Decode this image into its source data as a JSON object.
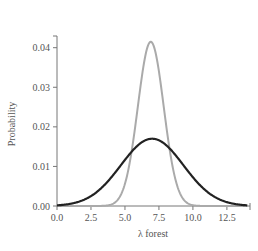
{
  "chart_data": {
    "type": "line",
    "title": "",
    "xlabel": "λ forest",
    "ylabel": "Probability",
    "xlim": [
      0,
      14.2
    ],
    "ylim": [
      0,
      0.047
    ],
    "grid": false,
    "legend": null,
    "x_ticks": [
      0.0,
      2.5,
      5.0,
      7.5,
      10.0,
      12.5
    ],
    "x_tick_labels": [
      "0.0",
      "2.5",
      "5.0",
      "7.5",
      "10.0",
      "12.5"
    ],
    "y_ticks": [
      0.0,
      0.01,
      0.02,
      0.03,
      0.04
    ],
    "y_tick_labels": [
      "0.00",
      "0.01",
      "0.02",
      "0.03",
      "0.04"
    ],
    "series": [
      {
        "name": "wide distribution",
        "color": "#222222",
        "shape": "gaussian",
        "mean": 7.0,
        "sd": 2.3,
        "peak": 0.017,
        "x": [
          0,
          1,
          2,
          3,
          4,
          5,
          6,
          7,
          8,
          9,
          10,
          11,
          12,
          13,
          14
        ],
        "values": [
          0.0001,
          0.0007,
          0.0018,
          0.0037,
          0.0072,
          0.0117,
          0.0155,
          0.017,
          0.0155,
          0.0117,
          0.0072,
          0.0037,
          0.0018,
          0.0006,
          0.0001
        ]
      },
      {
        "name": "narrow distribution",
        "color": "#aaaaaa",
        "shape": "gaussian",
        "mean": 6.9,
        "sd": 0.95,
        "peak": 0.0415,
        "x": [
          4,
          4.5,
          5,
          5.5,
          6,
          6.5,
          7,
          7.5,
          8,
          8.5,
          9,
          9.5,
          10
        ],
        "values": [
          0.0001,
          0.0017,
          0.006,
          0.0143,
          0.026,
          0.038,
          0.0415,
          0.034,
          0.022,
          0.01,
          0.0036,
          0.0009,
          0.0001
        ]
      }
    ]
  }
}
